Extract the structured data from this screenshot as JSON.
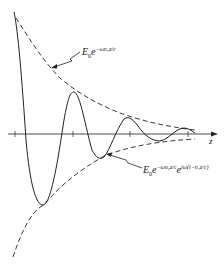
{
  "diagram": {
    "title": "",
    "axis_label": "z",
    "upper_envelope_label": {
      "base": "E",
      "base_sub": "0",
      "exp_base": "e",
      "exponent": "−ωn₂z/c"
    },
    "wave_label": {
      "base": "E",
      "base_sub": "0",
      "exp_base": "e",
      "exponent1": "−ωn₂z/c",
      "exp_base2": "e",
      "exponent2": "iω(t−n₁z/c)"
    },
    "colors": {
      "stroke": "#222222",
      "background": "#ffffff"
    }
  }
}
